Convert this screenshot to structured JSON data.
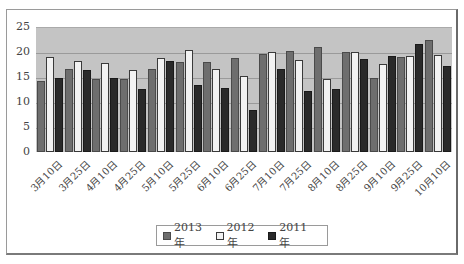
{
  "chart_data": {
    "type": "bar",
    "title": "",
    "xlabel": "",
    "ylabel": "",
    "ylim": [
      0,
      25
    ],
    "yticks": [
      0,
      5,
      10,
      15,
      20,
      25
    ],
    "grid": true,
    "legend_position": "bottom",
    "categories": [
      "3月10日",
      "3月25日",
      "4月10日",
      "4月25日",
      "5月10日",
      "5月25日",
      "6月10日",
      "6月25日",
      "7月10日",
      "7月25日",
      "8月10日",
      "8月25日",
      "9月10日",
      "9月25日",
      "10月10日"
    ],
    "series": [
      {
        "name": "2013 年",
        "color": "#6e6e6e",
        "values": [
          14.3,
          16.7,
          14.6,
          14.6,
          16.7,
          18.0,
          18.0,
          18.8,
          19.6,
          20.3,
          21.1,
          20.0,
          14.8,
          19.0,
          22.4
        ]
      },
      {
        "name": "2012 年",
        "color": "#f2f2f2",
        "values": [
          19.0,
          18.3,
          17.9,
          16.4,
          18.8,
          20.4,
          16.7,
          15.3,
          20.0,
          18.5,
          14.6,
          20.0,
          17.6,
          19.2,
          19.4
        ]
      },
      {
        "name": "2011 年",
        "color": "#2a2a2a",
        "values": [
          14.9,
          16.4,
          14.9,
          12.7,
          18.3,
          13.5,
          12.8,
          8.4,
          16.7,
          12.2,
          12.7,
          18.6,
          19.3,
          21.6,
          17.3
        ]
      }
    ]
  },
  "legend": {
    "items": [
      "2013 年",
      "2012 年",
      "2011 年"
    ]
  },
  "colors": {
    "plot_background": "#c4c4c4",
    "series_2013": "#6e6e6e",
    "series_2012": "#f2f2f2",
    "series_2011": "#2a2a2a"
  }
}
